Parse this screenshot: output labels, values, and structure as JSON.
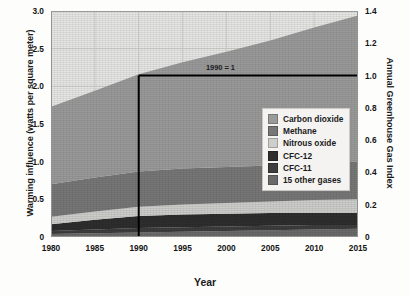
{
  "chart_data": {
    "type": "area",
    "title": "",
    "xlabel": "Year",
    "ylabel": "Warming influence (watts per square meter)",
    "ylabel_right": "Annual Greenhouse Gas Index",
    "xlim": [
      1980,
      2015
    ],
    "ylim": [
      0,
      3.0
    ],
    "ylim_right": [
      0,
      1.4
    ],
    "grid": true,
    "stacked": true,
    "legend_position": "inside-right",
    "x": [
      1980,
      1985,
      1990,
      1995,
      2000,
      2005,
      2010,
      2015
    ],
    "xticks": [
      "1980",
      "1985",
      "1990",
      "1995",
      "2000",
      "2005",
      "2010",
      "2015"
    ],
    "yticks_left": [
      "0",
      "0.5",
      "1.0",
      "1.5",
      "2.0",
      "2.5",
      "3.0"
    ],
    "yticks_right": [
      "0",
      "0.2",
      "0.4",
      "0.6",
      "0.8",
      "1.0",
      "1.2",
      "1.4"
    ],
    "series": [
      {
        "name": "15 other gases",
        "color": "#6a6a6a",
        "values": [
          0.04,
          0.05,
          0.06,
          0.07,
          0.08,
          0.09,
          0.1,
          0.11
        ]
      },
      {
        "name": "CFC-11",
        "color": "#3d3d3d",
        "values": [
          0.04,
          0.05,
          0.06,
          0.06,
          0.06,
          0.06,
          0.06,
          0.05
        ]
      },
      {
        "name": "CFC-12",
        "color": "#2e2e2e",
        "values": [
          0.09,
          0.13,
          0.16,
          0.17,
          0.17,
          0.17,
          0.16,
          0.16
        ]
      },
      {
        "name": "Nitrous oxide",
        "color": "#cdcdcb",
        "values": [
          0.1,
          0.11,
          0.12,
          0.13,
          0.14,
          0.15,
          0.17,
          0.18
        ]
      },
      {
        "name": "Methane",
        "color": "#777777",
        "values": [
          0.43,
          0.45,
          0.47,
          0.48,
          0.48,
          0.48,
          0.49,
          0.5
        ]
      },
      {
        "name": "Carbon dioxide",
        "color": "#9a9a9a",
        "values": [
          1.03,
          1.15,
          1.29,
          1.41,
          1.53,
          1.66,
          1.8,
          1.94
        ]
      }
    ],
    "annotations": [
      {
        "text": "1990 = 1",
        "x": 1990,
        "y_right": 1.0
      }
    ],
    "reference_lines": [
      {
        "orientation": "vertical",
        "x": 1990,
        "color": "#000000"
      },
      {
        "orientation": "horizontal",
        "y_right": 1.0,
        "color": "#000000"
      }
    ]
  },
  "legend": {
    "items": [
      {
        "label": "Carbon dioxide",
        "color": "#9a9a9a"
      },
      {
        "label": "Methane",
        "color": "#777777"
      },
      {
        "label": "Nitrous oxide",
        "color": "#cdcdcb"
      },
      {
        "label": "CFC-12",
        "color": "#2e2e2e"
      },
      {
        "label": "CFC-11",
        "color": "#3d3d3d"
      },
      {
        "label": "15 other gases",
        "color": "#6a6a6a"
      }
    ]
  },
  "colors": {
    "plot_background": "#e6e6e4",
    "grid": "#cfcfcd",
    "axis_text": "#141414",
    "reference_line": "#000000"
  }
}
